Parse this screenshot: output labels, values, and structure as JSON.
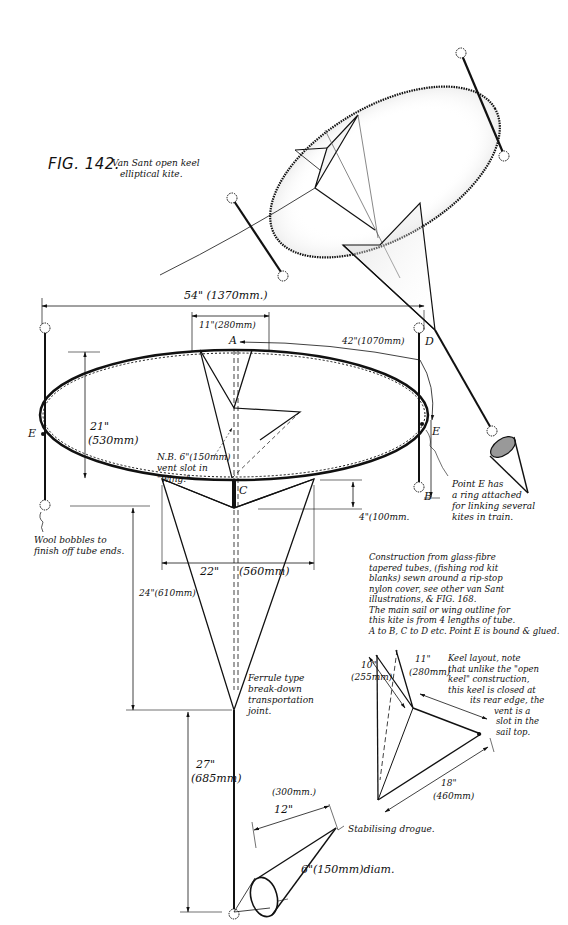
{
  "figure": {
    "number": "FIG. 142.",
    "caption_line1": "Van Sant open keel",
    "caption_line2": "elliptical kite."
  },
  "points": {
    "A": "A",
    "B": "B",
    "C": "C",
    "D": "D",
    "E_left": "E",
    "E_right": "E"
  },
  "dimensions": {
    "span": "54\" (1370mm.)",
    "top_width": "11\"(280mm)",
    "spar_length": "42\"(1070mm)",
    "height_in": "21\"",
    "height_mm": "(530mm)",
    "keel_drop": "4\"(100mm.",
    "keel_width_in": "22\"",
    "keel_width_mm": "(560mm)",
    "keel_height": "24\"(610mm)",
    "tail_in": "27\"",
    "tail_mm": "(685mm)",
    "drogue_len_mm": "(300mm.)",
    "drogue_len_in": "12\"",
    "drogue_diam": "6\"(150mm)diam.",
    "keel_side_in": "10\"",
    "keel_side_mm": "(255mm)",
    "keel_top_in": "11\"",
    "keel_top_mm": "(280mm)",
    "keel_base_in": "18\"",
    "keel_base_mm": "(460mm)"
  },
  "notes": {
    "vent_line1": "N.B. 6\"(150mm)",
    "vent_line2": "vent slot in",
    "vent_line3": "\"wing.\"",
    "point_e_line1": "Point E has",
    "point_e_line2": "a ring attached",
    "point_e_line3": "for linking several",
    "point_e_line4": "kites in train.",
    "bobbles_line1": "Wool bobbles to",
    "bobbles_line2": "finish off tube ends.",
    "ferrule_line1": "Ferrule type",
    "ferrule_line2": "break-down",
    "ferrule_line3": "transportation",
    "ferrule_line4": "joint.",
    "construction_line1": "Construction from glass-fibre",
    "construction_line2": "tapered tubes, (fishing rod kit",
    "construction_line3": "blanks) sewn around a rip-stop",
    "construction_line4": "nylon cover, see other van Sant",
    "construction_line5": "illustrations, & FIG. 168.",
    "construction_line6": "The main sail or wing outline for",
    "construction_line7": "this kite is from 4 lengths of tube.",
    "construction_line8": "A to B, C to D etc. Point E is bound & glued.",
    "keel_line1": "Keel layout, note",
    "keel_line2": "that unlike the \"open",
    "keel_line3": "keel\" construction,",
    "keel_line4": "this keel is closed at",
    "keel_line5": "its rear edge, the",
    "keel_line6": "vent is a",
    "keel_line7": "slot in the",
    "keel_line8": "sail top.",
    "drogue": "Stabilising drogue."
  },
  "icons": [
    "wool-bobble-icon",
    "drogue-cone-icon",
    "kite-perspective-illustration"
  ]
}
